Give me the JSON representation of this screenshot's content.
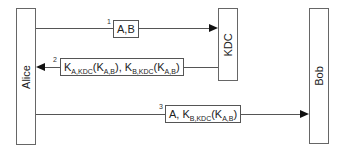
{
  "diagram": {
    "type": "sequence",
    "actors": [
      {
        "id": "alice",
        "label": "Alice"
      },
      {
        "id": "kdc",
        "label": "KDC"
      },
      {
        "id": "bob",
        "label": "Bob"
      }
    ],
    "messages": [
      {
        "number": "1",
        "from": "Alice",
        "to": "KDC",
        "text": "A,B"
      },
      {
        "number": "2",
        "from": "KDC",
        "to": "Alice",
        "parts": {
          "k1": "K",
          "k1_sub": "A,KDC",
          "open1": "(K",
          "s1": "A,B",
          "close1": "), K",
          "k2_sub": "B,KDC",
          "open2": "(K",
          "s2": "A,B",
          "close2": ")"
        }
      },
      {
        "number": "3",
        "from": "Alice",
        "to": "Bob",
        "parts": {
          "prefix": "A, K",
          "k_sub": "B,KDC",
          "open": "(K",
          "s": "A,B",
          "close": ")"
        }
      }
    ]
  }
}
